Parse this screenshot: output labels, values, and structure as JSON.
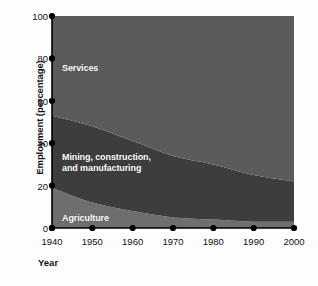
{
  "chart_data": {
    "type": "area",
    "stacked": true,
    "title": "",
    "xlabel": "Year",
    "ylabel": "Employment (percentage)",
    "xlim": [
      1940,
      2000
    ],
    "ylim": [
      0,
      100
    ],
    "grid": false,
    "legend_position": "inline-labels",
    "x": [
      1940,
      1950,
      1960,
      1970,
      1980,
      1990,
      2000
    ],
    "xticklabels": [
      "1940",
      "1950",
      "1960",
      "1970",
      "1980",
      "1990",
      "2000"
    ],
    "yticks": [
      0,
      20,
      40,
      60,
      80,
      100
    ],
    "yticklabels": [
      "0",
      "20",
      "40",
      "60",
      "80",
      "100"
    ],
    "series": [
      {
        "name": "Agriculture",
        "color": "#6e6e6e",
        "values": [
          19,
          12,
          8,
          5,
          4,
          3,
          3
        ]
      },
      {
        "name": "Mining, construction, and manufacturing",
        "label_line1": "Mining, construction,",
        "label_line2": "and manufacturing",
        "color": "#3d3d3d",
        "values": [
          34,
          36,
          33,
          29,
          26,
          22,
          19
        ]
      },
      {
        "name": "Services",
        "color": "#5b5b5b",
        "values": [
          47,
          52,
          59,
          66,
          70,
          75,
          78
        ]
      }
    ],
    "cumulative_upper_bounds": {
      "agriculture": [
        19,
        12,
        8,
        5,
        4,
        3,
        3
      ],
      "agriculture_plus_mining": [
        53,
        48,
        41,
        34,
        30,
        25,
        22
      ],
      "total": [
        100,
        100,
        100,
        100,
        100,
        100,
        100
      ]
    },
    "marker_color": "#000000",
    "axis_color": "#000000",
    "label_text_color": "#ffffff",
    "background": "#fdfdfd"
  }
}
